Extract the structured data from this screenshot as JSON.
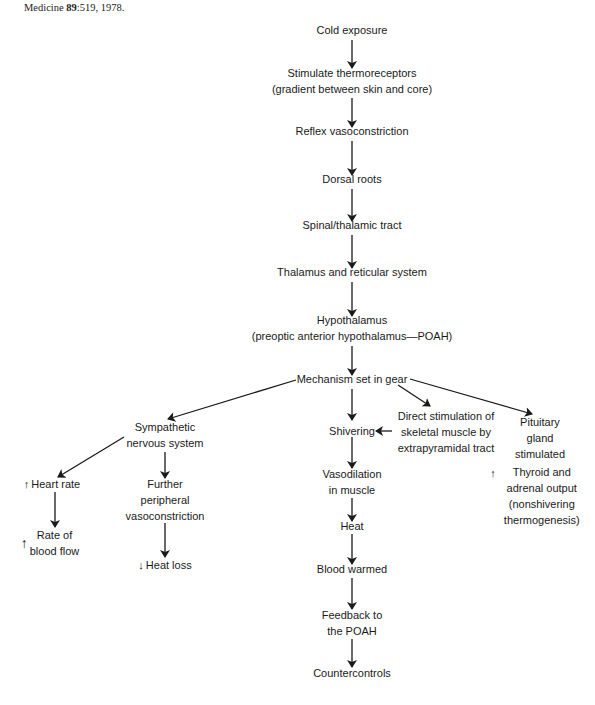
{
  "caption": {
    "journal": "Medicine",
    "volume": "89",
    "page": ":519, 1978."
  },
  "nodes": {
    "cold_exposure": {
      "lines": [
        "Cold exposure"
      ]
    },
    "stimulate": {
      "lines": [
        "Stimulate thermoreceptors",
        "(gradient between skin and core)"
      ]
    },
    "reflex": {
      "lines": [
        "Reflex vasoconstriction"
      ]
    },
    "dorsal": {
      "lines": [
        "Dorsal roots"
      ]
    },
    "spinal": {
      "lines": [
        "Spinal/thalamic tract"
      ]
    },
    "thalamus": {
      "lines": [
        "Thalamus and reticular system"
      ]
    },
    "hypothalamus": {
      "lines": [
        "Hypothalamus",
        "(preoptic anterior hypothalamus—POAH)"
      ]
    },
    "mechanism": {
      "lines": [
        "Mechanism set in gear"
      ]
    },
    "sympathetic": {
      "lines": [
        "Sympathetic",
        "nervous system"
      ]
    },
    "shivering": {
      "lines": [
        "Shivering"
      ]
    },
    "direct": {
      "lines": [
        "Direct stimulation of",
        "skeletal muscle by",
        "extrapyramidal tract"
      ]
    },
    "pituitary": {
      "lines": [
        "Pituitary",
        "gland",
        "stimulated"
      ]
    },
    "heart_rate": {
      "indicator": "↑",
      "lines": [
        "Heart rate"
      ]
    },
    "further": {
      "lines": [
        "Further",
        "peripheral",
        "vasoconstriction"
      ]
    },
    "blood_flow": {
      "indicator": "↑",
      "lines": [
        "Rate of",
        "blood flow"
      ]
    },
    "heat_loss": {
      "indicator": "↓",
      "lines": [
        "Heat loss"
      ]
    },
    "thyroid": {
      "indicator": "↑",
      "lines": [
        "Thyroid and",
        "adrenal output",
        "(nonshivering",
        "thermogenesis)"
      ]
    },
    "vasodilation": {
      "lines": [
        "Vasodilation",
        "in muscle"
      ]
    },
    "heat": {
      "lines": [
        "Heat"
      ]
    },
    "blood_warmed": {
      "lines": [
        "Blood warmed"
      ]
    },
    "feedback": {
      "lines": [
        "Feedback to",
        "the POAH"
      ]
    },
    "countercontrols": {
      "lines": [
        "Countercontrols"
      ]
    }
  },
  "colors": {
    "ink": "#1a1a1a",
    "background": "#ffffff"
  }
}
